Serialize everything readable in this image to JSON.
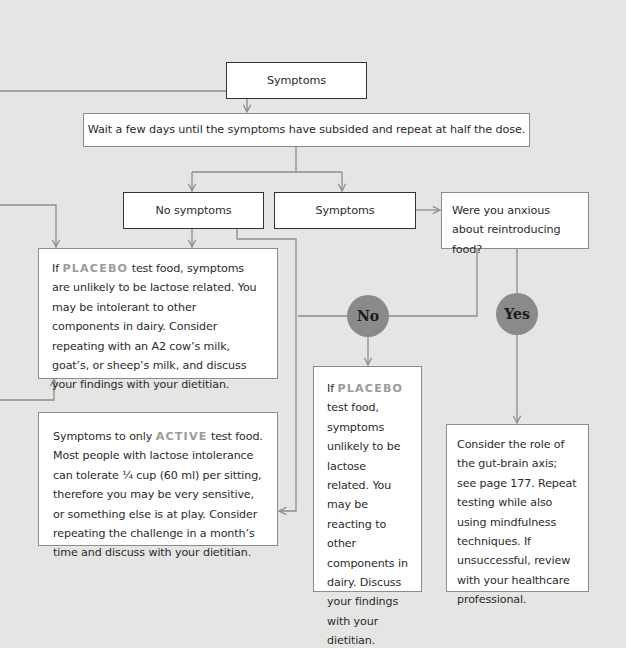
{
  "colors": {
    "background": "#e5e5e4",
    "box_fill": "#ffffff",
    "connector": "#8c8c8c",
    "decision_circle": "#8a8a8a",
    "highlight_text": "#9a9a9a"
  },
  "nodes": {
    "top_symptoms": {
      "label": "Symptoms"
    },
    "wait": {
      "label": "Wait a few days until the symptoms have subsided and repeat at half the dose."
    },
    "no_symptoms": {
      "label": "No symptoms"
    },
    "symptoms": {
      "label": "Symptoms"
    },
    "anxious_question": {
      "label": "Were you anxious about reintroducing food?"
    },
    "placebo_left": {
      "prefix": "If ",
      "highlight": "PLACEBO",
      "text": " test food, symptoms are unlikely to be lactose related. You may be intolerant to other components in dairy. Consider repeating with an A2 cow’s milk, goat’s, or sheep’s milk, and discuss your findings with your dietitian."
    },
    "active": {
      "prefix": "Symptoms to only ",
      "highlight": "ACTIVE",
      "text": "  test food. Most people with lactose intolerance can tolerate ¼ cup (60 ml) per sitting, therefore you may be very sensitive, or something else is at play. Consider repeating the challenge in a month’s time and discuss with your dietitian."
    },
    "placebo_no": {
      "prefix": "If ",
      "highlight": "PLACEBO",
      "text": " test food, symptoms unlikely to be lactose related. You may be reacting to other components in dairy. Discuss your findings with your dietitian."
    },
    "yes_outcome": {
      "text": "Consider the role of the gut-brain axis; see page 177. Repeat testing while also using mindfulness techniques. If unsuccessful, review with your healthcare professional."
    }
  },
  "decisions": {
    "no": "No",
    "yes": "Yes"
  }
}
